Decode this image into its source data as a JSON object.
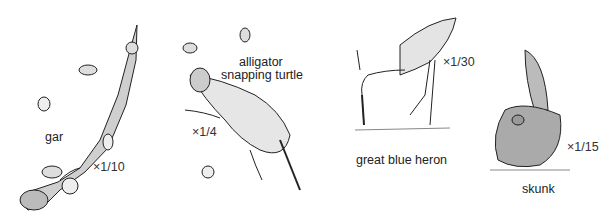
{
  "figure": {
    "animals": [
      {
        "name": "gar",
        "scale": "×1/10"
      },
      {
        "name": "alligator snapping turtle",
        "name_lines": [
          "alligator",
          "snapping turtle"
        ],
        "scale": "×1/4"
      },
      {
        "name": "great blue heron",
        "scale": "×1/30"
      },
      {
        "name": "skunk",
        "scale": "×1/15"
      }
    ]
  }
}
